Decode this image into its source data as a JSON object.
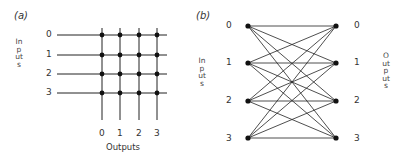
{
  "panel_a": {
    "label": "(a)",
    "inputs_title": "Inputs",
    "outputs_title": "Outputs",
    "input_labels": [
      "0",
      "1",
      "2",
      "3"
    ],
    "output_labels": [
      "0",
      "1",
      "2",
      "3"
    ],
    "type": "crossbar switch, 4x4, crosspoints at every intersection"
  },
  "panel_b": {
    "label": "(b)",
    "inputs_title": "Inputs",
    "outputs_title": "Outputs",
    "input_labels": [
      "0",
      "1",
      "2",
      "3"
    ],
    "output_labels": [
      "0",
      "1",
      "2",
      "3"
    ],
    "type": "fully connected bipartite network, every input linked to every output"
  }
}
